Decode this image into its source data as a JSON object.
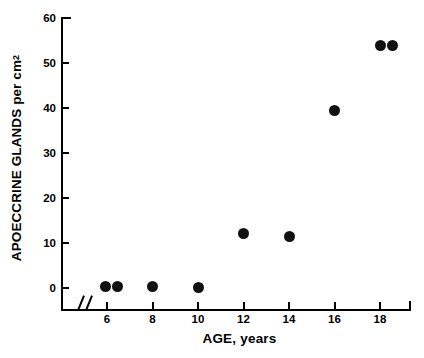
{
  "chart_data": {
    "type": "scatter",
    "title": "",
    "xlabel": "AGE, years",
    "ylabel": "APOECCRINE GLANDS per cm",
    "ylabel_superscript": "2",
    "xlim": [
      5.0,
      19.3
    ],
    "ylim": [
      0,
      60
    ],
    "xticks": [
      6,
      8,
      10,
      12,
      14,
      16,
      18
    ],
    "yticks": [
      0,
      10,
      20,
      30,
      40,
      50,
      60
    ],
    "xtick_labels": [
      "6",
      "8",
      "10",
      "12",
      "14",
      "16",
      "18"
    ],
    "ytick_labels": [
      "0",
      "10",
      "20",
      "30",
      "40",
      "50",
      "60"
    ],
    "grid": false,
    "legend": null,
    "axis_break": {
      "axis": "x",
      "symbol": "//",
      "position": 5.35
    },
    "marker": {
      "shape": "circle",
      "color": "#111111",
      "size": 11
    },
    "points": [
      {
        "x": 5.95,
        "y": 0.3
      },
      {
        "x": 6.45,
        "y": 0.3
      },
      {
        "x": 8.0,
        "y": 0.3
      },
      {
        "x": 10.0,
        "y": 0.2
      },
      {
        "x": 12.0,
        "y": 12.2
      },
      {
        "x": 14.0,
        "y": 11.5
      },
      {
        "x": 16.0,
        "y": 39.5
      },
      {
        "x": 18.0,
        "y": 54.0
      },
      {
        "x": 18.55,
        "y": 54.0
      }
    ]
  },
  "figure": {
    "background": "#ffffff",
    "axis_color": "#000000"
  }
}
